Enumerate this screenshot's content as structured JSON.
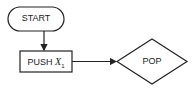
{
  "diagram": {
    "type": "flowchart",
    "nodes": [
      {
        "id": "start",
        "shape": "terminal",
        "label": "START"
      },
      {
        "id": "push",
        "shape": "process",
        "label": "PUSH ",
        "label_var": "X",
        "label_sub": "1"
      },
      {
        "id": "pop",
        "shape": "decision",
        "label": "POP"
      }
    ],
    "edges": [
      {
        "from": "start",
        "to": "push",
        "direction": "down"
      },
      {
        "from": "push",
        "to": "pop",
        "direction": "right"
      }
    ]
  }
}
